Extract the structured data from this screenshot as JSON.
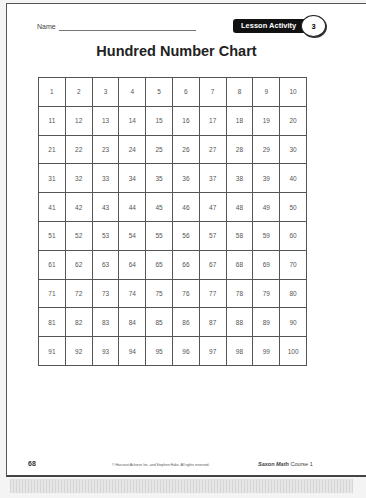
{
  "header": {
    "name_label": "Name",
    "badge_label": "Lesson Activity",
    "badge_number": "3"
  },
  "title": "Hundred Number Chart",
  "grid": {
    "rows": [
      [
        "1",
        "2",
        "3",
        "4",
        "5",
        "6",
        "7",
        "8",
        "9",
        "10"
      ],
      [
        "11",
        "12",
        "13",
        "14",
        "15",
        "16",
        "17",
        "18",
        "19",
        "20"
      ],
      [
        "21",
        "22",
        "23",
        "24",
        "25",
        "26",
        "27",
        "28",
        "29",
        "30"
      ],
      [
        "31",
        "32",
        "33",
        "34",
        "35",
        "36",
        "37",
        "38",
        "39",
        "40"
      ],
      [
        "41",
        "42",
        "43",
        "44",
        "45",
        "46",
        "47",
        "48",
        "49",
        "50"
      ],
      [
        "51",
        "52",
        "53",
        "54",
        "55",
        "56",
        "57",
        "58",
        "59",
        "60"
      ],
      [
        "61",
        "62",
        "63",
        "64",
        "65",
        "66",
        "67",
        "68",
        "69",
        "70"
      ],
      [
        "71",
        "72",
        "73",
        "74",
        "75",
        "76",
        "77",
        "78",
        "79",
        "80"
      ],
      [
        "81",
        "82",
        "83",
        "84",
        "85",
        "86",
        "87",
        "88",
        "89",
        "90"
      ],
      [
        "91",
        "92",
        "93",
        "94",
        "95",
        "96",
        "97",
        "98",
        "99",
        "100"
      ]
    ]
  },
  "footer": {
    "page_number": "68",
    "copyright": "© Harcourt Achieve Inc. and Stephen Hake. All rights reserved.",
    "brand": "Saxon Math",
    "course": "Course 1"
  }
}
